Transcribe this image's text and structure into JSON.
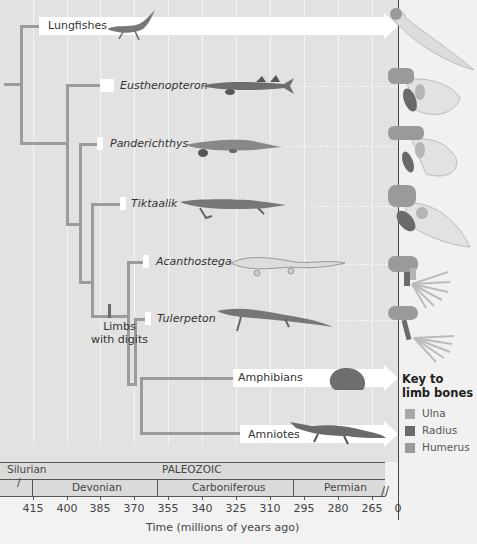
{
  "colors": {
    "background": "#e2e2e2",
    "branch": "#9b9b9b",
    "gridline": "#f4f4f4",
    "ulna": "#a8a8a8",
    "radius": "#6a6a6a",
    "humerus": "#9a9a9a"
  },
  "taxa": [
    {
      "name": "Lungfishes",
      "style": "normal",
      "icon": "lungfish-illustration",
      "limb_icon": "lungfish-fin-bones"
    },
    {
      "name": "Eusthenopteron",
      "style": "italic",
      "icon": "eusthenopteron-illustration",
      "limb_icon": "eusthenopteron-fin-bones"
    },
    {
      "name": "Panderichthys",
      "style": "italic",
      "icon": "panderichthys-illustration",
      "limb_icon": "panderichthys-fin-bones"
    },
    {
      "name": "Tiktaalik",
      "style": "italic",
      "icon": "tiktaalik-illustration",
      "limb_icon": "tiktaalik-fin-bones"
    },
    {
      "name": "Acanthostega",
      "style": "italic",
      "icon": "acanthostega-illustration",
      "limb_icon": "acanthostega-limb-bones"
    },
    {
      "name": "Tulerpeton",
      "style": "italic",
      "icon": "tulerpeton-illustration",
      "limb_icon": "tulerpeton-limb-bones"
    },
    {
      "name": "Amphibians",
      "style": "normal",
      "icon": "frog-illustration"
    },
    {
      "name": "Amniotes",
      "style": "normal",
      "icon": "crocodile-illustration"
    }
  ],
  "annotation": {
    "line1": "Limbs",
    "line2": "with digits"
  },
  "key": {
    "title_line1": "Key to",
    "title_line2": "limb bones",
    "items": [
      {
        "label": "Ulna",
        "color": "#a8a8a8"
      },
      {
        "label": "Radius",
        "color": "#6a6a6a"
      },
      {
        "label": "Humerus",
        "color": "#9a9a9a"
      }
    ]
  },
  "timescale": {
    "era": "PALEOZOIC",
    "periods": [
      "Silurian",
      "Devonian",
      "Carboniferous",
      "Permian"
    ],
    "ticks": [
      "415",
      "400",
      "385",
      "370",
      "355",
      "340",
      "325",
      "310",
      "295",
      "280",
      "265",
      "0"
    ],
    "axis_label": "Time (millions of years ago)"
  }
}
